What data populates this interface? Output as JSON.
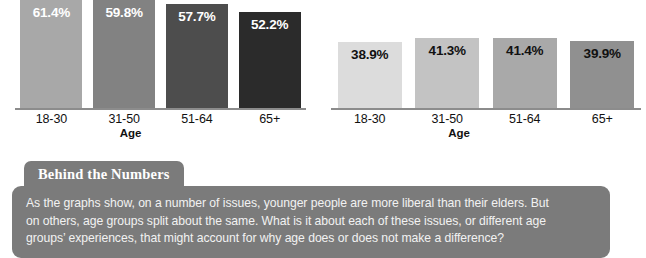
{
  "chart_data": [
    {
      "type": "bar",
      "title": "",
      "xlabel": "Age",
      "ylabel": "",
      "categories": [
        "18-30",
        "31-50",
        "51-64",
        "65+"
      ],
      "values": [
        61.4,
        59.8,
        57.7,
        52.2
      ],
      "value_labels": [
        "61.4%",
        "59.8%",
        "57.7%",
        "52.2%"
      ],
      "bar_colors": [
        "#a8a8a8",
        "#828282",
        "#4d4d4d",
        "#2b2b2b"
      ],
      "value_label_colors": [
        "#ffffff",
        "#ffffff",
        "#ffffff",
        "#ffffff"
      ],
      "bar_heights_px": [
        112,
        110,
        104,
        96
      ],
      "ylim": [
        0,
        66
      ],
      "grid": false,
      "legend": "none"
    },
    {
      "type": "bar",
      "title": "",
      "xlabel": "Age",
      "ylabel": "",
      "categories": [
        "18-30",
        "31-50",
        "51-64",
        "65+"
      ],
      "values": [
        38.9,
        41.3,
        41.4,
        39.9
      ],
      "value_labels": [
        "38.9%",
        "41.3%",
        "41.4%",
        "39.9%"
      ],
      "bar_colors": [
        "#dcdcdc",
        "#c3c3c3",
        "#a9a9a9",
        "#909090"
      ],
      "value_label_colors": [
        "#111111",
        "#111111",
        "#111111",
        "#111111"
      ],
      "bar_heights_px": [
        66,
        70,
        70,
        67
      ],
      "ylim": [
        0,
        66
      ],
      "grid": false,
      "legend": "none"
    }
  ],
  "callout": {
    "tab_label": "Behind the Numbers",
    "lines": [
      "As the graphs show, on a number of issues, younger people are more liberal than their elders. But",
      "on others, age groups split about the same. What is it about each of these issues, or different age",
      "groups’ experiences, that might account for why age does or does not make a difference?"
    ],
    "background_color": "#7b7b7b",
    "text_color": "#f2f2f2"
  },
  "axis_color": "#8c8c8c"
}
